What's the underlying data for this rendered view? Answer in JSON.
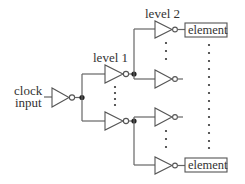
{
  "diagram": {
    "input_label_line1": "clock",
    "input_label_line2": "input",
    "level1_label": "level 1",
    "level2_label": "level 2",
    "element_top_label": "element",
    "element_bottom_label": "element",
    "nodes": [
      {
        "id": "clock-input",
        "type": "label",
        "text": "clock input"
      },
      {
        "id": "root-buffer",
        "type": "inverting-buffer"
      },
      {
        "id": "l1-top",
        "type": "inverting-buffer",
        "level": 1
      },
      {
        "id": "l1-bottom",
        "type": "inverting-buffer",
        "level": 1
      },
      {
        "id": "l2-1",
        "type": "inverting-buffer",
        "level": 2
      },
      {
        "id": "l2-2",
        "type": "inverting-buffer",
        "level": 2
      },
      {
        "id": "l2-3",
        "type": "inverting-buffer",
        "level": 2
      },
      {
        "id": "l2-4",
        "type": "inverting-buffer",
        "level": 2
      },
      {
        "id": "element-top",
        "type": "box",
        "text": "element"
      },
      {
        "id": "element-bottom",
        "type": "box",
        "text": "element"
      }
    ],
    "edges": [
      {
        "from": "clock-input",
        "to": "root-buffer"
      },
      {
        "from": "root-buffer",
        "to": "l1-top"
      },
      {
        "from": "root-buffer",
        "to": "l1-bottom"
      },
      {
        "from": "l1-top",
        "to": "l2-1"
      },
      {
        "from": "l1-top",
        "to": "l2-2"
      },
      {
        "from": "l1-bottom",
        "to": "l2-3"
      },
      {
        "from": "l1-bottom",
        "to": "l2-4"
      },
      {
        "from": "l2-1",
        "to": "element-top"
      },
      {
        "from": "l2-4",
        "to": "element-bottom"
      }
    ],
    "ellipses": [
      "between level 1 buffers",
      "between level 2 buffers (top pair)",
      "between level 2 buffers (bottom pair)",
      "between elements"
    ]
  }
}
